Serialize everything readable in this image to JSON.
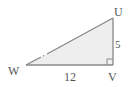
{
  "diagram": {
    "type": "right-triangle",
    "vertices": {
      "U": {
        "label": "U"
      },
      "V": {
        "label": "V"
      },
      "W": {
        "label": "W"
      }
    },
    "right_angle_at": "V",
    "sides": {
      "UV": {
        "label": "5"
      },
      "WV": {
        "label": "12"
      }
    },
    "colors": {
      "fill": "#eeeeee",
      "stroke": "#888888",
      "text": "#555555"
    }
  }
}
